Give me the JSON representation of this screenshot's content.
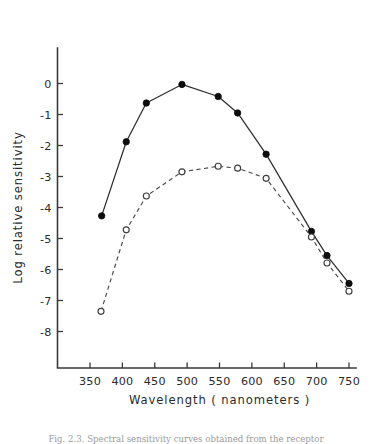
{
  "figure": {
    "background_color": "#ffffff",
    "caption": "Fig. 2.3. Spectral sensitivity curves obtained from the receptor"
  },
  "chart_data": {
    "type": "line",
    "title": "",
    "xlabel": "Wavelength  ( nanometers )",
    "ylabel": "Log relative sensitivity",
    "xlim": [
      325,
      765
    ],
    "ylim": [
      -8.8,
      0.9
    ],
    "xticks": [
      350,
      400,
      450,
      500,
      550,
      600,
      650,
      700,
      750
    ],
    "xticklabels": [
      "350",
      "400",
      "450",
      "500",
      "550",
      "600",
      "650",
      "700",
      "750"
    ],
    "yticks": [
      0,
      -1,
      -2,
      -3,
      -4,
      -5,
      -6,
      -7,
      -8
    ],
    "yticklabels": [
      "0",
      "-1",
      "-2",
      "-3",
      "-4",
      "-5",
      "-6",
      "-7",
      "-8"
    ],
    "grid": false,
    "legend": "none",
    "series": [
      {
        "name": "filled-circle-series",
        "marker": "filled-circle",
        "linestyle": "solid",
        "color": "#0d0d0d",
        "x": [
          368,
          406,
          437,
          492,
          548,
          578,
          622,
          692,
          716,
          750
        ],
        "values": [
          -4.27,
          -1.88,
          -0.63,
          -0.03,
          -0.42,
          -0.95,
          -2.28,
          -4.77,
          -5.55,
          -6.45
        ]
      },
      {
        "name": "open-circle-series",
        "marker": "open-circle",
        "linestyle": "dashed",
        "color": "#3d3d3d",
        "x": [
          367,
          406,
          437,
          492,
          548,
          578,
          622,
          692,
          716,
          750
        ],
        "values": [
          -7.35,
          -4.72,
          -3.63,
          -2.85,
          -2.67,
          -2.73,
          -3.06,
          -4.95,
          -5.79,
          -6.7
        ]
      }
    ]
  }
}
